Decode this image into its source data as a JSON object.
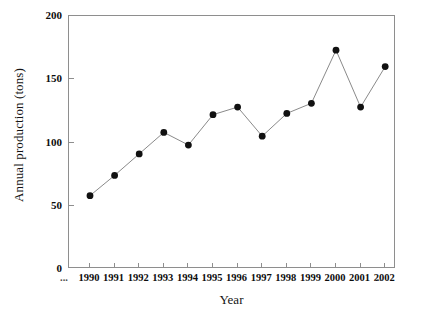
{
  "chart_data": {
    "type": "line",
    "title": "",
    "xlabel": "Year",
    "ylabel": "Annual production (tons)",
    "categories": [
      "1990",
      "1991",
      "1992",
      "1993",
      "1994",
      "1995",
      "1996",
      "1997",
      "1998",
      "1999",
      "2000",
      "2001",
      "2002"
    ],
    "values": [
      58,
      74,
      91,
      108,
      98,
      122,
      128,
      105,
      123,
      131,
      173,
      128,
      160
    ],
    "series": [
      {
        "name": "Annual production",
        "values": [
          58,
          74,
          91,
          108,
          98,
          122,
          128,
          105,
          123,
          131,
          173,
          128,
          160
        ]
      }
    ],
    "ylim": [
      0,
      200
    ],
    "yticks": [
      0,
      50,
      100,
      150,
      200
    ],
    "ytick_labels": [
      "0",
      "50",
      "100",
      "150",
      "200"
    ],
    "xtick_labels": [
      "1990",
      "1991",
      "1992",
      "1993",
      "1994",
      "1995",
      "1996",
      "1997",
      "1998",
      "1999",
      "2000",
      "2001",
      "2002"
    ],
    "axis_break_left": "...",
    "axis_break_right": "...",
    "grid": false,
    "legend": false,
    "marker": "filled-circle",
    "marker_color": "#111111",
    "line_color": "#8a8a8a",
    "frame_color": "#8e8e8e",
    "background": "#ffffff"
  }
}
